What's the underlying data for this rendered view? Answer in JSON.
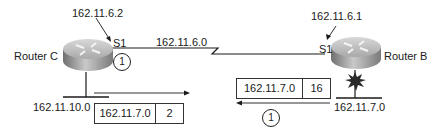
{
  "diagram": {
    "routers": [
      {
        "name": "Router C",
        "interface": "S1",
        "interface_ip": "162.11.6.2",
        "lan": "162.11.10.0"
      },
      {
        "name": "Router B",
        "interface": "S1",
        "interface_ip": "162.11.6.1",
        "lan": "162.11.7.0",
        "lan_status": "failed"
      }
    ],
    "serial_link": {
      "network": "162.11.6.0"
    },
    "updates": [
      {
        "network": "162.11.7.0",
        "metric": "2",
        "direction": "Router C outbound (right)",
        "step": "1"
      },
      {
        "network": "162.11.7.0",
        "metric": "16",
        "direction": "Router B outbound (left)",
        "step": "1"
      }
    ],
    "colors": {
      "line": "#1a1a1a",
      "router_top": "#c8c8c8",
      "router_side": "#8a8a8a",
      "failure_burst": "#2a2a2a"
    }
  }
}
